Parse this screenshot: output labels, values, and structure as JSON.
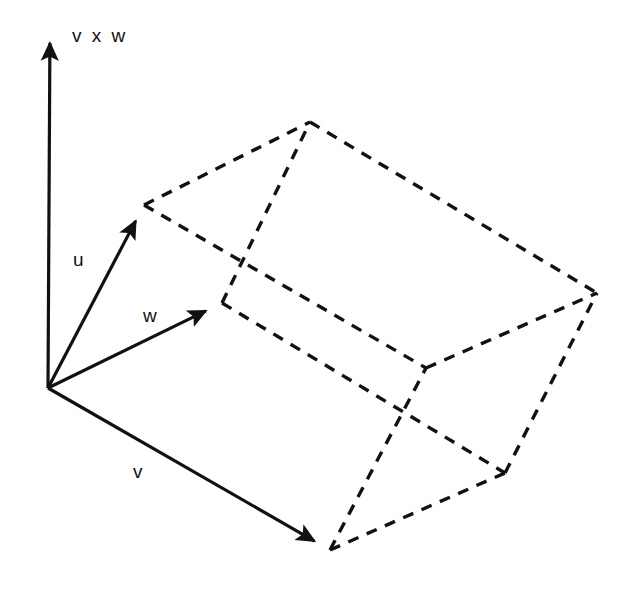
{
  "figure": {
    "type": "vector-diagram",
    "background_color": "#ffffff",
    "stroke_color": "#111111",
    "solid_stroke_width": 3.2,
    "dashed_stroke_width": 3.4,
    "dash_pattern": "11 9",
    "canvas": {
      "width": 633,
      "height": 589
    }
  },
  "labels": {
    "cross_product": "v x w",
    "u": "u",
    "v": "v",
    "w": "w"
  },
  "label_positions": {
    "cross_product": {
      "x": 72,
      "y": 26
    },
    "u": {
      "x": 73,
      "y": 250
    },
    "v": {
      "x": 133,
      "y": 462
    },
    "w": {
      "x": 143,
      "y": 306
    }
  },
  "points": {
    "origin": {
      "x": 48,
      "y": 388
    },
    "axis_tip": {
      "x": 50,
      "y": 25
    },
    "u_tip": {
      "x": 144,
      "y": 205
    },
    "w_tip": {
      "x": 222,
      "y": 303
    },
    "v_tip": {
      "x": 330,
      "y": 550
    },
    "u_plus_w": {
      "x": 310,
      "y": 122
    },
    "u_plus_v": {
      "x": 426,
      "y": 368
    },
    "v_plus_w": {
      "x": 505,
      "y": 473
    },
    "u_plus_v_plus_w": {
      "x": 597,
      "y": 293
    }
  },
  "solid_arrows": [
    {
      "name": "cross-product-axis",
      "from": "origin",
      "to": "axis_tip",
      "label": "v x w"
    },
    {
      "name": "vector-u",
      "from": "origin",
      "to": "u_tip",
      "label": "u"
    },
    {
      "name": "vector-w",
      "from": "origin",
      "to": "w_tip",
      "label": "w"
    },
    {
      "name": "vector-v",
      "from": "origin",
      "to": "v_tip",
      "label": "v"
    }
  ],
  "dashed_edges": [
    {
      "name": "u-to-uw",
      "from": "u_tip",
      "to": "u_plus_w"
    },
    {
      "name": "w-to-uw",
      "from": "w_tip",
      "to": "u_plus_w"
    },
    {
      "name": "u-to-uv",
      "from": "u_tip",
      "to": "u_plus_v"
    },
    {
      "name": "v-to-uv",
      "from": "v_tip",
      "to": "u_plus_v"
    },
    {
      "name": "w-to-vw",
      "from": "w_tip",
      "to": "v_plus_w"
    },
    {
      "name": "v-to-vw",
      "from": "v_tip",
      "to": "v_plus_w"
    },
    {
      "name": "uw-to-uvw",
      "from": "u_plus_w",
      "to": "u_plus_v_plus_w"
    },
    {
      "name": "uv-to-uvw",
      "from": "u_plus_v",
      "to": "u_plus_v_plus_w"
    },
    {
      "name": "vw-to-uvw",
      "from": "v_plus_w",
      "to": "u_plus_v_plus_w"
    }
  ]
}
